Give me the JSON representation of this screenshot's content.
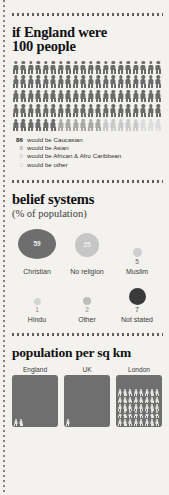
{
  "meta": {
    "palette": {
      "background": "#f4f2ef",
      "ink": "#1b1b1b",
      "dark_figure": "#6b6b6b",
      "mid_figure": "#a8a8a8",
      "light_figure": "#c9c9c9",
      "pale_figure": "#dcdcdc",
      "bubble_dark": "#6e6e6e",
      "bubble_mid": "#b4b4b4",
      "bubble_light": "#d2d2d2",
      "bubble_black": "#3a3a3a",
      "panel_fill": "#6f6f6f"
    }
  },
  "section_people": {
    "title_line1": "if England were",
    "title_line2": "100 people",
    "total_figures": 100,
    "columns": 20,
    "rows": 5,
    "legend": [
      {
        "num": "86",
        "label": "would be Caucasian",
        "color": "#6b6b6b",
        "count": 86
      },
      {
        "num": "6",
        "label": "would be Asian",
        "color": "#a8a8a8",
        "count": 6
      },
      {
        "num": "5",
        "label": "would be African & Afro Caribbean",
        "color": "#c9c9c9",
        "count": 5
      },
      {
        "num": "3",
        "label": "would be other",
        "color": "#dcdcdc",
        "count": 3
      }
    ]
  },
  "section_belief": {
    "title": "belief systems",
    "subtitle": "(% of population)",
    "items": [
      {
        "label": "Christian",
        "value": "59",
        "show_inside": true,
        "size": 38,
        "color": "#6e6e6e",
        "text_color": "#efefef"
      },
      {
        "label": "No religion",
        "value": "25",
        "show_inside": true,
        "size": 24,
        "color": "#c6c6c6",
        "text_color": "#efefef"
      },
      {
        "label": "Muslim",
        "value": "5",
        "show_inside": false,
        "size": 9,
        "color": "#cfcfcf",
        "text_color": "#666666"
      },
      {
        "label": "Hindu",
        "value": "1",
        "show_inside": false,
        "size": 7,
        "color": "#d5d5d5",
        "text_color": "#8a8a8a"
      },
      {
        "label": "Other",
        "value": "2",
        "show_inside": false,
        "size": 8,
        "color": "#bdbdbd",
        "text_color": "#8a8a8a"
      },
      {
        "label": "Not stated",
        "value": "7",
        "show_inside": false,
        "size": 17,
        "color": "#3a3a3a",
        "text_color": "#333333"
      }
    ]
  },
  "section_density": {
    "title": "population per sq km",
    "panels": [
      {
        "label": "England",
        "figures": 2
      },
      {
        "label": "UK",
        "figures": 1
      },
      {
        "label": "London",
        "figures": 40
      }
    ]
  },
  "chart_data": [
    {
      "type": "pictogram",
      "title": "if England were 100 people",
      "categories": [
        "Caucasian",
        "Asian",
        "African & Afro Caribbean",
        "Other"
      ],
      "values": [
        86,
        6,
        5,
        3
      ],
      "unit": "people per 100",
      "total": 100
    },
    {
      "type": "bubble",
      "title": "belief systems",
      "subtitle": "(% of population)",
      "categories": [
        "Christian",
        "No religion",
        "Muslim",
        "Hindu",
        "Other",
        "Not stated"
      ],
      "values": [
        59,
        25,
        5,
        1,
        2,
        7
      ],
      "ylabel": "% of population"
    },
    {
      "type": "pictogram",
      "title": "population per sq km",
      "categories": [
        "England",
        "UK",
        "London"
      ],
      "values": [
        2,
        1,
        40
      ],
      "unit": "figures shown"
    }
  ]
}
